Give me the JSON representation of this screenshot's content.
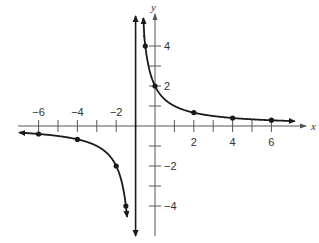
{
  "chart_data": {
    "type": "line",
    "title": "",
    "function": "y = 2/(x+1)",
    "xlabel": "x",
    "ylabel": "y",
    "xlim": [
      -7,
      7
    ],
    "ylim": [
      -5.5,
      5.5
    ],
    "grid": false,
    "legend": null,
    "vertical_asymptote": {
      "x": -1,
      "style": "solid line with arrows both ends"
    },
    "horizontal_asymptote": {
      "y": 0
    },
    "x_ticks": [
      -6,
      -5,
      -4,
      -3,
      -2,
      -1,
      1,
      2,
      3,
      4,
      5,
      6
    ],
    "x_tick_labels": [
      "-6",
      "-4",
      "-2",
      "2",
      "4",
      "6"
    ],
    "x_tick_label_values": [
      -6,
      -4,
      -2,
      2,
      4,
      6
    ],
    "y_ticks": [
      -4,
      -3,
      -2,
      -1,
      1,
      2,
      3,
      4
    ],
    "y_tick_labels": [
      "4",
      "2",
      "-2",
      "-4"
    ],
    "y_tick_label_values": [
      4,
      2,
      -2,
      -4
    ],
    "series": [
      {
        "name": "left branch",
        "points": [
          [
            -6,
            -0.4
          ],
          [
            -4,
            -0.67
          ],
          [
            -2,
            -2
          ],
          [
            -1.5,
            -4
          ]
        ]
      },
      {
        "name": "right branch",
        "points": [
          [
            -0.5,
            4
          ],
          [
            0,
            2
          ],
          [
            2,
            0.67
          ],
          [
            4,
            0.4
          ],
          [
            6,
            0.29
          ]
        ]
      }
    ]
  },
  "colors": {
    "axis": "#555555",
    "curve": "#1a1a1a",
    "background": "#ffffff"
  },
  "layout": {
    "origin_px": [
      155,
      126
    ],
    "px_per_unit_x": 19.4,
    "px_per_unit_y": 20
  }
}
